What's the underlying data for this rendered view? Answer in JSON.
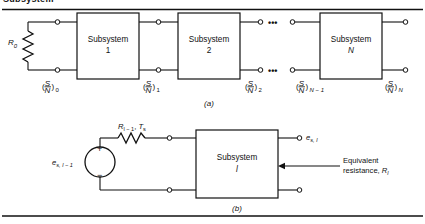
{
  "page": {
    "cut_off_heading": "Subsystem",
    "background": "#ffffff",
    "line_color": "#111111"
  },
  "panel_a": {
    "caption": "(a)",
    "source_resistor_label": "R",
    "source_resistor_sub": "0",
    "blocks": [
      {
        "name": "Subsystem",
        "index": "1"
      },
      {
        "name": "Subsystem",
        "index": "2"
      },
      {
        "name": "Subsystem",
        "index": "N"
      }
    ],
    "ellipsis": "•••",
    "sn_numerator": "S",
    "sn_denominator": "N",
    "sn_points": [
      {
        "subscript": "0"
      },
      {
        "subscript": "1"
      },
      {
        "subscript": "2"
      },
      {
        "subscript": "N − 1"
      },
      {
        "subscript": "N"
      }
    ]
  },
  "panel_b": {
    "caption": "(b)",
    "source_label_base": "e",
    "source_label_sub": "s, l − 1",
    "plus_sign": "+",
    "minus_sign": "−",
    "resistor_label_base": "R",
    "resistor_label_sub": "l − 1",
    "resistor_label_temp_base": "T",
    "resistor_label_temp_sub": "s",
    "block": {
      "name": "Subsystem",
      "index": "l"
    },
    "output_label_base": "e",
    "output_label_sub": "s, l",
    "annotation_line1": "Equivalent",
    "annotation_line2_prefix": "resistance, ",
    "annotation_line2_base": "R",
    "annotation_line2_sub": "l"
  }
}
